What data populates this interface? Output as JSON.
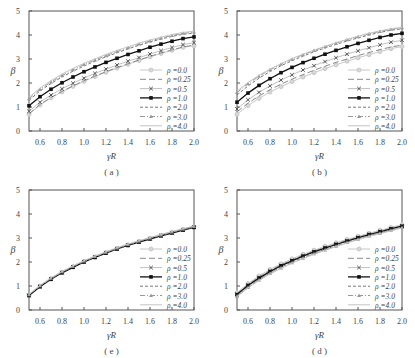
{
  "chart_data": [
    {
      "type": "line",
      "panel_label": "( a )",
      "xlabel": "γR",
      "ylabel": "β",
      "xlim": [
        0.5,
        2.0
      ],
      "ylim": [
        0,
        5
      ],
      "xticks": [
        "0.6",
        "0.8",
        "1.0",
        "1.2",
        "1.4",
        "1.6",
        "1.8",
        "2.0"
      ],
      "yticks": [
        "0",
        "1",
        "2",
        "3",
        "4",
        "5"
      ],
      "legend_position": "lower right",
      "x": [
        0.5,
        0.6,
        0.7,
        0.8,
        0.9,
        1.0,
        1.1,
        1.2,
        1.3,
        1.4,
        1.5,
        1.6,
        1.7,
        1.8,
        1.9,
        2.0
      ],
      "series": [
        {
          "name": "ρ =0.0",
          "values": [
            0.7,
            1.08,
            1.38,
            1.63,
            1.86,
            2.07,
            2.27,
            2.45,
            2.62,
            2.78,
            2.94,
            3.09,
            3.23,
            3.36,
            3.49,
            3.55
          ]
        },
        {
          "name": "ρ =0.25",
          "values": [
            0.72,
            1.1,
            1.4,
            1.65,
            1.88,
            2.09,
            2.29,
            2.47,
            2.64,
            2.8,
            2.96,
            3.11,
            3.25,
            3.38,
            3.5,
            3.58
          ]
        },
        {
          "name": "ρ =0.5",
          "values": [
            0.82,
            1.2,
            1.5,
            1.76,
            1.99,
            2.2,
            2.4,
            2.58,
            2.75,
            2.91,
            3.06,
            3.21,
            3.35,
            3.48,
            3.6,
            3.68
          ]
        },
        {
          "name": "ρ =1.0",
          "values": [
            1.05,
            1.43,
            1.74,
            2.01,
            2.25,
            2.47,
            2.67,
            2.86,
            3.03,
            3.19,
            3.34,
            3.49,
            3.62,
            3.74,
            3.85,
            3.92
          ]
        },
        {
          "name": "ρ =2.0",
          "values": [
            1.28,
            1.67,
            1.98,
            2.25,
            2.49,
            2.71,
            2.91,
            3.09,
            3.26,
            3.42,
            3.57,
            3.71,
            3.83,
            3.94,
            4.03,
            4.08
          ]
        },
        {
          "name": "ρ =3.0",
          "values": [
            1.34,
            1.73,
            2.04,
            2.31,
            2.55,
            2.77,
            2.96,
            3.14,
            3.31,
            3.47,
            3.62,
            3.75,
            3.87,
            3.98,
            4.07,
            4.12
          ]
        },
        {
          "name": "ρ =4.0",
          "values": [
            1.4,
            1.79,
            2.1,
            2.37,
            2.61,
            2.82,
            3.01,
            3.19,
            3.36,
            3.51,
            3.66,
            3.79,
            3.91,
            4.02,
            4.11,
            4.16
          ]
        }
      ]
    },
    {
      "type": "line",
      "panel_label": "( b )",
      "xlabel": "γR",
      "ylabel": "β",
      "xlim": [
        0.5,
        2.0
      ],
      "ylim": [
        0,
        5
      ],
      "xticks": [
        "0.6",
        "0.8",
        "1.0",
        "1.2",
        "1.4",
        "1.6",
        "1.8",
        "2.0"
      ],
      "yticks": [
        "0",
        "1",
        "2",
        "3",
        "4",
        "5"
      ],
      "legend_position": "lower right",
      "x": [
        0.5,
        0.6,
        0.7,
        0.8,
        0.9,
        1.0,
        1.1,
        1.2,
        1.3,
        1.4,
        1.5,
        1.6,
        1.7,
        1.8,
        1.9,
        2.0
      ],
      "series": [
        {
          "name": "ρ =0.0",
          "values": [
            0.7,
            1.06,
            1.36,
            1.62,
            1.85,
            2.06,
            2.25,
            2.43,
            2.6,
            2.76,
            2.91,
            3.05,
            3.18,
            3.31,
            3.43,
            3.52
          ]
        },
        {
          "name": "ρ =0.25",
          "values": [
            0.8,
            1.16,
            1.46,
            1.72,
            1.95,
            2.16,
            2.35,
            2.53,
            2.7,
            2.86,
            3.0,
            3.14,
            3.27,
            3.39,
            3.5,
            3.58
          ]
        },
        {
          "name": "ρ =0.5",
          "values": [
            0.92,
            1.3,
            1.61,
            1.88,
            2.12,
            2.34,
            2.54,
            2.72,
            2.89,
            3.05,
            3.2,
            3.34,
            3.47,
            3.59,
            3.7,
            3.78
          ]
        },
        {
          "name": "ρ =1.0",
          "values": [
            1.2,
            1.58,
            1.9,
            2.18,
            2.43,
            2.65,
            2.85,
            3.03,
            3.2,
            3.36,
            3.51,
            3.65,
            3.78,
            3.9,
            4.0,
            4.07
          ]
        },
        {
          "name": "ρ =2.0",
          "values": [
            1.5,
            1.88,
            2.2,
            2.48,
            2.72,
            2.93,
            3.12,
            3.3,
            3.46,
            3.61,
            3.75,
            3.88,
            4.0,
            4.11,
            4.2,
            4.26
          ]
        },
        {
          "name": "ρ =3.0",
          "values": [
            1.6,
            1.97,
            2.28,
            2.55,
            2.78,
            2.99,
            3.18,
            3.35,
            3.51,
            3.66,
            3.8,
            3.93,
            4.05,
            4.15,
            4.24,
            4.3
          ]
        },
        {
          "name": "ρ =4.0",
          "values": [
            1.66,
            2.02,
            2.32,
            2.58,
            2.81,
            3.02,
            3.2,
            3.37,
            3.53,
            3.68,
            3.82,
            3.95,
            4.07,
            4.17,
            4.26,
            4.32
          ]
        }
      ]
    },
    {
      "type": "line",
      "panel_label": "( e )",
      "xlabel": "γR",
      "ylabel": "β",
      "xlim": [
        0.5,
        2.0
      ],
      "ylim": [
        0,
        5
      ],
      "xticks": [
        "0.6",
        "0.8",
        "1.0",
        "1.2",
        "1.4",
        "1.6",
        "1.8",
        "2.0"
      ],
      "yticks": [
        "0",
        "1",
        "2",
        "3",
        "4",
        "5"
      ],
      "legend_position": "lower right",
      "x": [
        0.5,
        0.6,
        0.7,
        0.8,
        0.9,
        1.0,
        1.1,
        1.2,
        1.3,
        1.4,
        1.5,
        1.6,
        1.7,
        1.8,
        1.9,
        2.0
      ],
      "series": [
        {
          "name": "ρ =0.0",
          "values": [
            0.62,
            0.99,
            1.3,
            1.57,
            1.8,
            2.02,
            2.21,
            2.39,
            2.56,
            2.71,
            2.85,
            2.98,
            3.11,
            3.23,
            3.35,
            3.46
          ]
        },
        {
          "name": "ρ =0.25",
          "values": [
            0.62,
            0.99,
            1.3,
            1.57,
            1.8,
            2.02,
            2.21,
            2.39,
            2.56,
            2.71,
            2.85,
            2.98,
            3.11,
            3.23,
            3.35,
            3.46
          ]
        },
        {
          "name": "ρ =0.5",
          "values": [
            0.61,
            0.98,
            1.29,
            1.56,
            1.79,
            2.01,
            2.2,
            2.38,
            2.55,
            2.7,
            2.84,
            2.97,
            3.1,
            3.22,
            3.34,
            3.45
          ]
        },
        {
          "name": "ρ =1.0",
          "values": [
            0.6,
            0.97,
            1.28,
            1.55,
            1.78,
            2.0,
            2.19,
            2.37,
            2.54,
            2.69,
            2.83,
            2.96,
            3.09,
            3.21,
            3.33,
            3.44
          ]
        },
        {
          "name": "ρ =2.0",
          "values": [
            0.62,
            0.99,
            1.3,
            1.57,
            1.8,
            2.02,
            2.21,
            2.39,
            2.56,
            2.71,
            2.85,
            2.98,
            3.11,
            3.23,
            3.35,
            3.46
          ]
        },
        {
          "name": "ρ =3.0",
          "values": [
            0.64,
            1.01,
            1.32,
            1.59,
            1.82,
            2.04,
            2.23,
            2.41,
            2.58,
            2.73,
            2.87,
            3.0,
            3.13,
            3.25,
            3.37,
            3.48
          ]
        },
        {
          "name": "ρ =4.0",
          "values": [
            0.66,
            1.03,
            1.34,
            1.61,
            1.84,
            2.06,
            2.25,
            2.43,
            2.6,
            2.75,
            2.89,
            3.02,
            3.15,
            3.27,
            3.39,
            3.5
          ]
        }
      ]
    },
    {
      "type": "line",
      "panel_label": "( d )",
      "xlabel": "γR",
      "ylabel": "β",
      "xlim": [
        0.5,
        2.0
      ],
      "ylim": [
        0,
        5
      ],
      "xticks": [
        "0.6",
        "0.8",
        "1.0",
        "1.2",
        "1.4",
        "1.6",
        "1.8",
        "2.0"
      ],
      "yticks": [
        "0",
        "1",
        "2",
        "3",
        "4",
        "5"
      ],
      "legend_position": "lower right",
      "x": [
        0.5,
        0.6,
        0.7,
        0.8,
        0.9,
        1.0,
        1.1,
        1.2,
        1.3,
        1.4,
        1.5,
        1.6,
        1.7,
        1.8,
        1.9,
        2.0
      ],
      "series": [
        {
          "name": "ρ =0.0",
          "values": [
            0.72,
            1.1,
            1.42,
            1.69,
            1.92,
            2.13,
            2.32,
            2.49,
            2.65,
            2.8,
            2.94,
            3.07,
            3.2,
            3.32,
            3.44,
            3.55
          ]
        },
        {
          "name": "ρ =0.25",
          "values": [
            0.68,
            1.06,
            1.38,
            1.65,
            1.88,
            2.09,
            2.28,
            2.45,
            2.61,
            2.76,
            2.9,
            3.03,
            3.16,
            3.28,
            3.4,
            3.51
          ]
        },
        {
          "name": "ρ =0.5",
          "values": [
            0.66,
            1.04,
            1.36,
            1.63,
            1.86,
            2.07,
            2.26,
            2.43,
            2.59,
            2.74,
            2.88,
            3.02,
            3.15,
            3.27,
            3.39,
            3.5
          ]
        },
        {
          "name": "ρ =1.0",
          "values": [
            0.64,
            1.02,
            1.33,
            1.6,
            1.84,
            2.05,
            2.24,
            2.42,
            2.58,
            2.73,
            2.87,
            3.01,
            3.14,
            3.26,
            3.38,
            3.49
          ]
        },
        {
          "name": "ρ =2.0",
          "values": [
            0.6,
            0.97,
            1.28,
            1.55,
            1.79,
            2.0,
            2.19,
            2.37,
            2.53,
            2.68,
            2.83,
            2.97,
            3.1,
            3.22,
            3.34,
            3.46
          ]
        },
        {
          "name": "ρ =3.0",
          "values": [
            0.57,
            0.94,
            1.25,
            1.52,
            1.75,
            1.97,
            2.16,
            2.34,
            2.5,
            2.66,
            2.81,
            2.95,
            3.08,
            3.2,
            3.32,
            3.44
          ]
        },
        {
          "name": "ρ =4.0",
          "values": [
            0.55,
            0.92,
            1.23,
            1.5,
            1.73,
            1.95,
            2.14,
            2.32,
            2.48,
            2.64,
            2.79,
            2.93,
            3.06,
            3.18,
            3.3,
            3.42
          ]
        }
      ]
    }
  ],
  "series_styles": [
    {
      "marker": "circle",
      "dash": "",
      "color": "#c8c8c8",
      "marker_fill": "#d8d8d8",
      "width": 1
    },
    {
      "marker": "none",
      "dash": "6,3",
      "color": "#8a8a8a",
      "marker_fill": "none",
      "width": 1
    },
    {
      "marker": "x",
      "dash": "",
      "color": "#b0b0b0",
      "marker_fill": "#555555",
      "width": 0.8
    },
    {
      "marker": "square",
      "dash": "",
      "color": "#111111",
      "marker_fill": "#111111",
      "width": 1.3
    },
    {
      "marker": "none",
      "dash": "3,2",
      "color": "#777777",
      "marker_fill": "none",
      "width": 1
    },
    {
      "marker": "triangle",
      "dash": "5,2,1,2",
      "color": "#9a9a9a",
      "marker_fill": "#9a9a9a",
      "width": 1
    },
    {
      "marker": "none",
      "dash": "",
      "color": "#c4c4c4",
      "marker_fill": "none",
      "width": 1
    }
  ]
}
